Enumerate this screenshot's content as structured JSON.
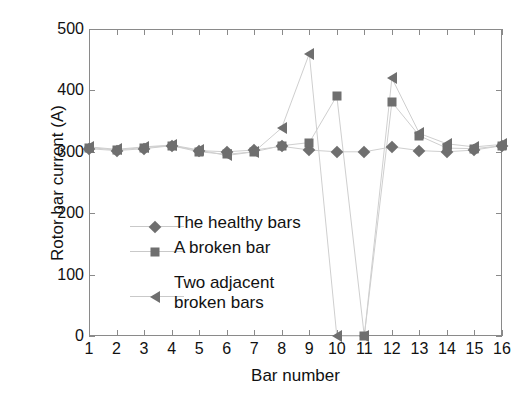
{
  "chart_data": {
    "type": "line",
    "title": "",
    "xlabel": "Bar number",
    "ylabel": "Rotor bar current (A)",
    "xlim": [
      1,
      16
    ],
    "ylim": [
      0,
      500
    ],
    "xticks": [
      1,
      2,
      3,
      4,
      5,
      6,
      7,
      8,
      9,
      10,
      11,
      12,
      13,
      14,
      15,
      16
    ],
    "yticks": [
      0,
      100,
      200,
      300,
      400,
      500
    ],
    "xtick_labels": [
      "1",
      "2",
      "3",
      "4",
      "5",
      "6",
      "7",
      "8",
      "9",
      "10",
      "11",
      "12",
      "13",
      "14",
      "15",
      "16"
    ],
    "ytick_labels": [
      "0",
      "100",
      "200",
      "300",
      "400",
      "500"
    ],
    "grid": false,
    "legend_position": "center-left-inside",
    "categories": [
      1,
      2,
      3,
      4,
      5,
      6,
      7,
      8,
      9,
      10,
      11,
      12,
      13,
      14,
      15,
      16
    ],
    "series": [
      {
        "name": "The healthy bars",
        "marker": "diamond",
        "color": "#6f6f6f",
        "values": [
          305,
          302,
          305,
          310,
          302,
          300,
          303,
          309,
          303,
          300,
          300,
          308,
          302,
          300,
          303,
          310
        ]
      },
      {
        "name": "A broken bar",
        "marker": "square",
        "color": "#6f6f6f",
        "values": [
          307,
          303,
          307,
          310,
          300,
          296,
          300,
          310,
          315,
          391,
          0,
          381,
          326,
          306,
          305,
          310
        ]
      },
      {
        "name": "Two adjacent broken bars",
        "marker": "left-triangle",
        "color": "#6f6f6f",
        "values": [
          308,
          304,
          308,
          311,
          303,
          294,
          300,
          339,
          460,
          0,
          0,
          420,
          330,
          313,
          308,
          312
        ]
      }
    ]
  },
  "legend": {
    "items": [
      {
        "label": "The healthy bars",
        "label2": "",
        "marker": "diamond"
      },
      {
        "label": "A broken bar",
        "label2": "",
        "marker": "square"
      },
      {
        "label": "Two adjacent",
        "label2": "broken bars",
        "marker": "left-triangle"
      }
    ]
  },
  "axes": {
    "x_title": "Bar number",
    "y_title": "Rotor bar current (A)"
  }
}
